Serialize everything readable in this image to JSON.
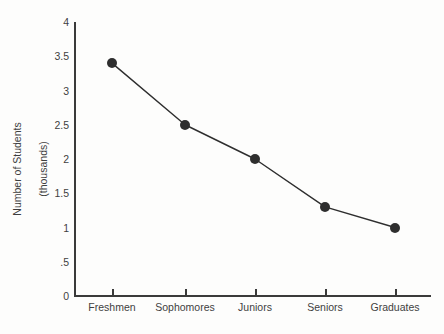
{
  "chart_data": {
    "type": "line",
    "title": "",
    "xlabel": "",
    "ylabel": "Number of Students\n(thousands)",
    "ylabel_line1": "Number of Students",
    "ylabel_line2": "(thousands)",
    "categories": [
      "Freshmen",
      "Sophomores",
      "Juniors",
      "Seniors",
      "Graduates"
    ],
    "values": [
      3.4,
      2.5,
      2.0,
      1.3,
      1.0
    ],
    "ylim": [
      0,
      4
    ],
    "ytick_values": [
      0,
      0.5,
      1,
      1.5,
      2,
      2.5,
      3,
      3.5,
      4
    ],
    "ytick_labels": [
      "0",
      ".5",
      "1",
      "1.5",
      "2",
      "2.5",
      "3",
      "3.5",
      "4"
    ],
    "grid": false,
    "legend": false,
    "legend_position": "none",
    "marker": "filled-circle",
    "series": [
      {
        "name": "Number of Students",
        "values": [
          3.4,
          2.5,
          2.0,
          1.3,
          1.0
        ]
      }
    ],
    "colors": {
      "line": "#2e2e2e",
      "marker": "#2e2e2e",
      "axis": "#3a3a3a",
      "text": "#3f3f3f",
      "background": "#fdfdfc"
    }
  }
}
